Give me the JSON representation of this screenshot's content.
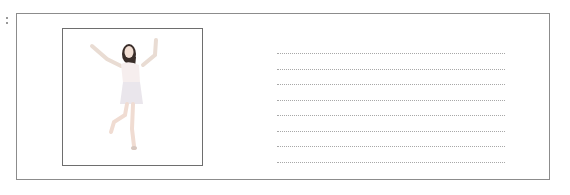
{
  "worksheet": {
    "photo": {
      "subject": "woman-dancing-figure",
      "alt": "Woman posing with arms raised, standing on one leg"
    },
    "writing_lines": {
      "count": 8
    },
    "colors": {
      "border": "#8c8c8c",
      "line": "#a8a8a8"
    }
  }
}
